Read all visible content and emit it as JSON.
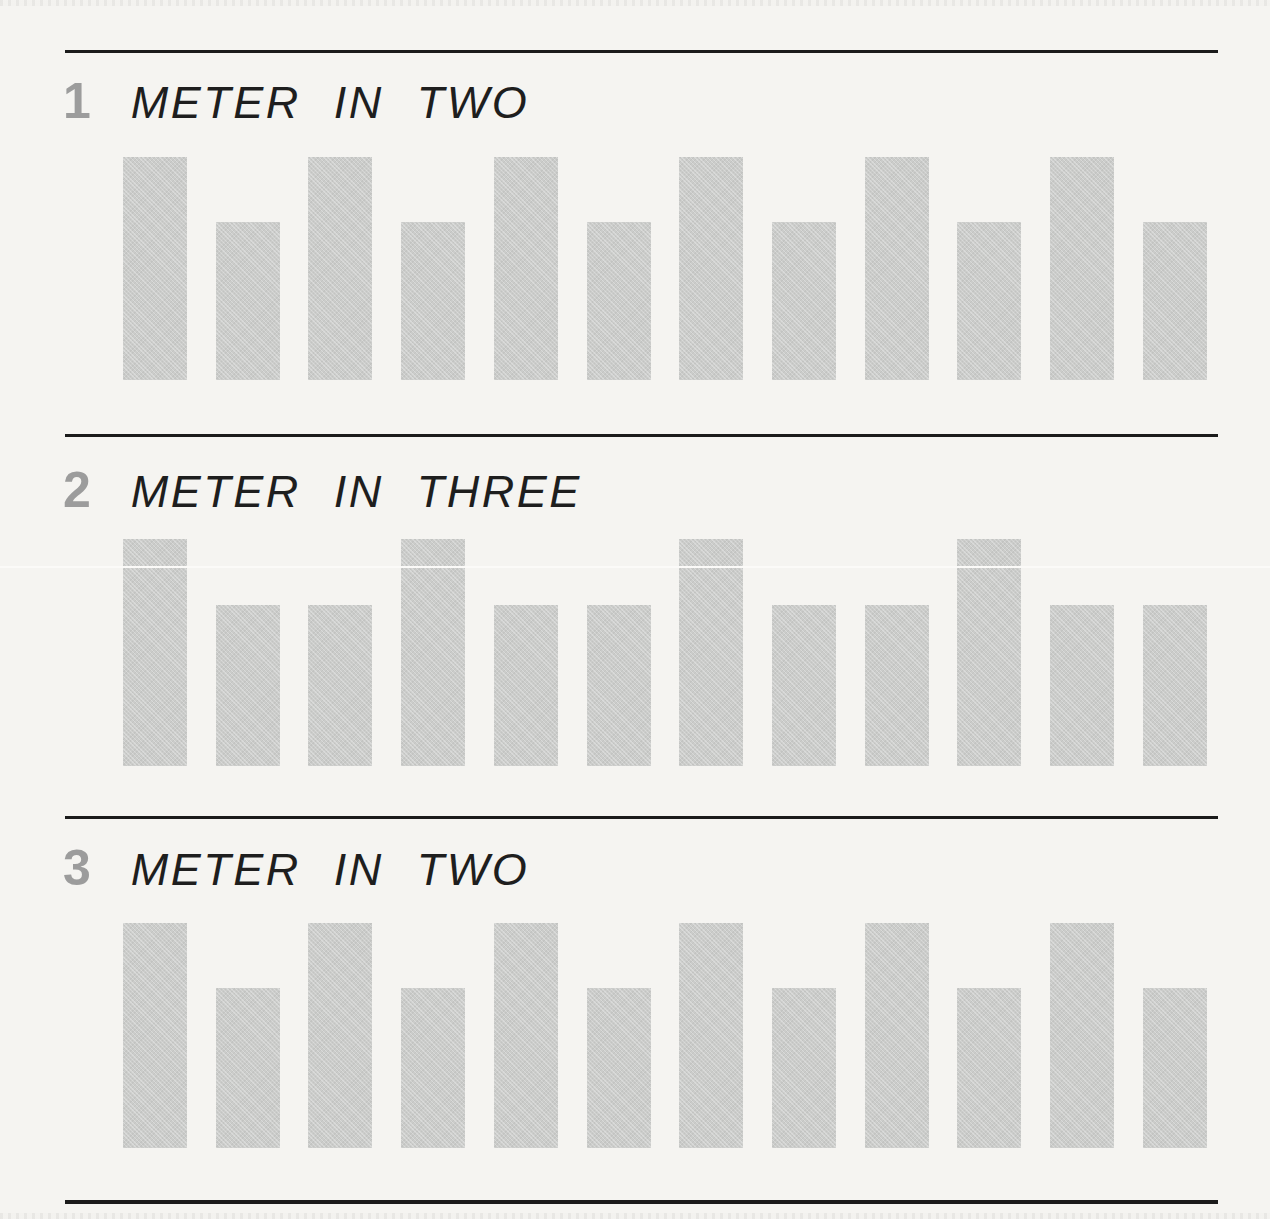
{
  "page": {
    "background_color": "#f5f4f1",
    "rule_color": "#1b1b1b",
    "bar_color": "#cbccca",
    "section_number_color": "#9c9c9c",
    "heading_text_color": "#1e1e1e"
  },
  "sections": [
    {
      "number": "1",
      "title": "METER IN TWO",
      "beats_per_measure": 2,
      "bar_count": 12,
      "bar_heights_pct": [
        100,
        71,
        100,
        71,
        100,
        71,
        100,
        71,
        100,
        71,
        100,
        71
      ]
    },
    {
      "number": "2",
      "title": "METER IN THREE",
      "beats_per_measure": 3,
      "bar_count": 12,
      "bar_heights_pct": [
        100,
        71,
        71,
        100,
        71,
        71,
        100,
        71,
        71,
        100,
        71,
        71
      ]
    },
    {
      "number": "3",
      "title": "METER IN TWO",
      "beats_per_measure": 2,
      "bar_count": 12,
      "bar_heights_pct": [
        100,
        71,
        100,
        71,
        100,
        71,
        100,
        71,
        100,
        71,
        100,
        71
      ]
    }
  ]
}
